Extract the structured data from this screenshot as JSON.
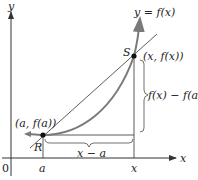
{
  "diagram": {
    "type": "secant-line-graph",
    "axes": {
      "x_label": "x",
      "y_label": "y",
      "origin_label": "0"
    },
    "curve_label": "y = f(x)",
    "points": {
      "R": {
        "name": "R",
        "coord_label": "(a, f(a))"
      },
      "S": {
        "name": "S",
        "coord_label": "(x, f(x))"
      }
    },
    "tick_labels": {
      "a": "a",
      "x": "x"
    },
    "brackets": {
      "horizontal": "x − a",
      "vertical": "f(x) − f(a)"
    },
    "colors": {
      "curve": "#7a7a7a",
      "secant": "#333333",
      "axes": "#333333",
      "points": "#111111"
    }
  }
}
